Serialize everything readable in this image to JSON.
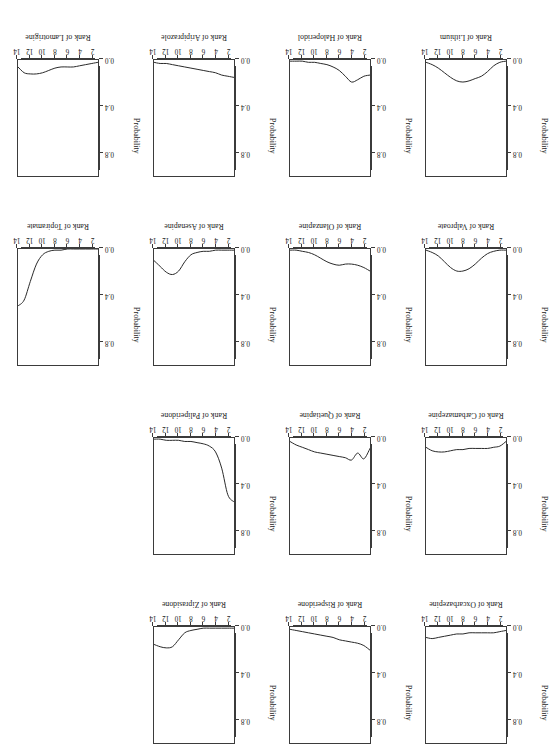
{
  "figure": {
    "rotation_degrees": 180,
    "panel_rows": 4,
    "panel_cols": 4,
    "panel_count": 14,
    "axis_color": "#3b3b3b",
    "curve_color": "#2a2a2a"
  },
  "axes": {
    "ylabel": "Probability",
    "ytick_labels": [
      "0.0",
      "0.4",
      "0.8"
    ],
    "ytick_values": [
      0.0,
      0.4,
      0.8
    ],
    "ylim": [
      0.0,
      1.0
    ],
    "xtick_labels": [
      "2",
      "4",
      "6",
      "8",
      "10",
      "12",
      "14"
    ],
    "xtick_values": [
      2,
      4,
      6,
      8,
      10,
      12,
      14
    ],
    "xlim": [
      1,
      14
    ],
    "xlabel_prefix": "Rank of"
  },
  "chart_data": {
    "type": "line",
    "title": "",
    "subtitle": "",
    "xlabel": "Rank",
    "ylabel": "Probability",
    "xlim": [
      1,
      14
    ],
    "ylim": [
      0.0,
      1.0
    ],
    "grid": false,
    "legend": "none",
    "x": [
      1,
      2,
      3,
      4,
      5,
      6,
      7,
      8,
      9,
      10,
      11,
      12,
      13,
      14
    ],
    "panel_order": [
      "Lamotrigine",
      "Aripiprazole",
      "Haloperidol",
      "Lithium",
      "Topiramate",
      "Asenapine",
      "Olanzapine",
      "Valproate",
      "Paliperidone",
      "Quetiapine",
      "Carbamazepine",
      "Ziprasidone",
      "Risperidone",
      "Oxcarbazepine"
    ],
    "series": [
      {
        "name": "Lamotrigine",
        "xlabel": "Rank of Lamotrigine",
        "values": [
          0.02,
          0.03,
          0.04,
          0.05,
          0.06,
          0.06,
          0.06,
          0.07,
          0.09,
          0.11,
          0.12,
          0.12,
          0.11,
          0.06
        ]
      },
      {
        "name": "Aripiprazole",
        "xlabel": "Rank of Aripiprazole",
        "values": [
          0.15,
          0.14,
          0.13,
          0.11,
          0.1,
          0.09,
          0.08,
          0.07,
          0.06,
          0.05,
          0.04,
          0.03,
          0.03,
          0.02
        ]
      },
      {
        "name": "Haloperidol",
        "xlabel": "Rank of Haloperidol",
        "values": [
          0.13,
          0.14,
          0.17,
          0.19,
          0.14,
          0.09,
          0.06,
          0.04,
          0.03,
          0.02,
          0.02,
          0.01,
          0.01,
          0.01
        ]
      },
      {
        "name": "Lithium",
        "xlabel": "Rank of Lithium",
        "values": [
          0.01,
          0.02,
          0.05,
          0.1,
          0.14,
          0.16,
          0.18,
          0.19,
          0.18,
          0.15,
          0.11,
          0.07,
          0.04,
          0.02
        ]
      },
      {
        "name": "Topiramate",
        "xlabel": "Rank of Topiramate",
        "values": [
          0.0,
          0.0,
          0.0,
          0.0,
          0.0,
          0.0,
          0.01,
          0.01,
          0.02,
          0.05,
          0.13,
          0.28,
          0.44,
          0.49
        ]
      },
      {
        "name": "Asenapine",
        "xlabel": "Rank of Asenapine",
        "values": [
          0.01,
          0.01,
          0.01,
          0.01,
          0.02,
          0.02,
          0.03,
          0.05,
          0.11,
          0.19,
          0.22,
          0.2,
          0.15,
          0.1
        ]
      },
      {
        "name": "Olanzapine",
        "xlabel": "Rank of Olanzapine",
        "values": [
          0.19,
          0.16,
          0.14,
          0.13,
          0.13,
          0.14,
          0.13,
          0.11,
          0.08,
          0.05,
          0.03,
          0.02,
          0.01,
          0.01
        ]
      },
      {
        "name": "Valproate",
        "xlabel": "Rank of Valproate",
        "values": [
          0.01,
          0.01,
          0.02,
          0.04,
          0.08,
          0.13,
          0.17,
          0.19,
          0.19,
          0.16,
          0.11,
          0.06,
          0.03,
          0.01
        ]
      },
      {
        "name": "Paliperidone",
        "xlabel": "Rank of Paliperidone",
        "values": [
          0.55,
          0.49,
          0.26,
          0.12,
          0.07,
          0.05,
          0.04,
          0.03,
          0.03,
          0.02,
          0.02,
          0.02,
          0.01,
          0.01
        ]
      },
      {
        "name": "Quetiapine",
        "xlabel": "Rank of Quetiapine",
        "values": [
          0.09,
          0.18,
          0.13,
          0.19,
          0.17,
          0.16,
          0.15,
          0.14,
          0.13,
          0.12,
          0.1,
          0.08,
          0.06,
          0.03
        ]
      },
      {
        "name": "Carbamazepine",
        "xlabel": "Rank of Carbamazepine",
        "values": [
          0.03,
          0.07,
          0.08,
          0.09,
          0.09,
          0.09,
          0.09,
          0.1,
          0.1,
          0.11,
          0.12,
          0.12,
          0.11,
          0.08
        ]
      },
      {
        "name": "Ziprasidone",
        "xlabel": "Rank of Ziprasidone",
        "values": [
          0.01,
          0.01,
          0.01,
          0.01,
          0.01,
          0.01,
          0.02,
          0.03,
          0.05,
          0.11,
          0.17,
          0.18,
          0.17,
          0.15
        ]
      },
      {
        "name": "Risperidone",
        "xlabel": "Rank of Risperidone",
        "values": [
          0.2,
          0.16,
          0.14,
          0.13,
          0.12,
          0.11,
          0.09,
          0.08,
          0.07,
          0.06,
          0.05,
          0.04,
          0.03,
          0.02
        ]
      },
      {
        "name": "Oxcarbazepine",
        "xlabel": "Rank of Oxcarbazepine",
        "values": [
          0.03,
          0.04,
          0.05,
          0.05,
          0.05,
          0.05,
          0.05,
          0.06,
          0.06,
          0.07,
          0.08,
          0.09,
          0.1,
          0.09
        ]
      }
    ]
  },
  "grid_layout": [
    [
      "Oxcarbazepine",
      "Risperidone",
      "Ziprasidone",
      null
    ],
    [
      "Carbamazepine",
      "Quetiapine",
      "Paliperidone",
      null
    ],
    [
      "Valproate",
      "Olanzapine",
      "Asenapine",
      "Topiramate"
    ],
    [
      "Lithium",
      "Haloperidol",
      "Aripiprazole",
      "Lamotrigine"
    ]
  ]
}
